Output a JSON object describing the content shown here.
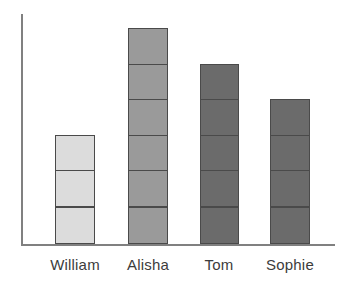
{
  "chart_data": {
    "type": "bar",
    "title": "",
    "subtitle": "",
    "xlabel": "",
    "ylabel": "",
    "categories": [
      "William",
      "Alisha",
      "Tom",
      "Sophie"
    ],
    "values": [
      3,
      6,
      5,
      4
    ],
    "unit": "blocks",
    "series": [
      {
        "name": "Blocks",
        "values": [
          3,
          6,
          5,
          4
        ]
      }
    ],
    "ylim": [
      0,
      6.5
    ],
    "grid": false,
    "legend": null,
    "axis_tick_labels": [],
    "bars": [
      {
        "category": "William",
        "blocks": 3,
        "color": "#dcdcdc"
      },
      {
        "category": "Alisha",
        "blocks": 6,
        "color": "#9a9a9a"
      },
      {
        "category": "Tom",
        "blocks": 5,
        "color": "#6b6b6b"
      },
      {
        "category": "Sophie",
        "blocks": 4,
        "color": "#6b6b6b"
      }
    ],
    "annotations": []
  },
  "style": {
    "axis_color": "#808080",
    "segment_border": "#4a4a4a",
    "label_color": "#3c3c3c",
    "background": "#ffffff"
  },
  "labels": {
    "cat0": "William",
    "cat1": "Alisha",
    "cat2": "Tom",
    "cat3": "Sophie"
  }
}
